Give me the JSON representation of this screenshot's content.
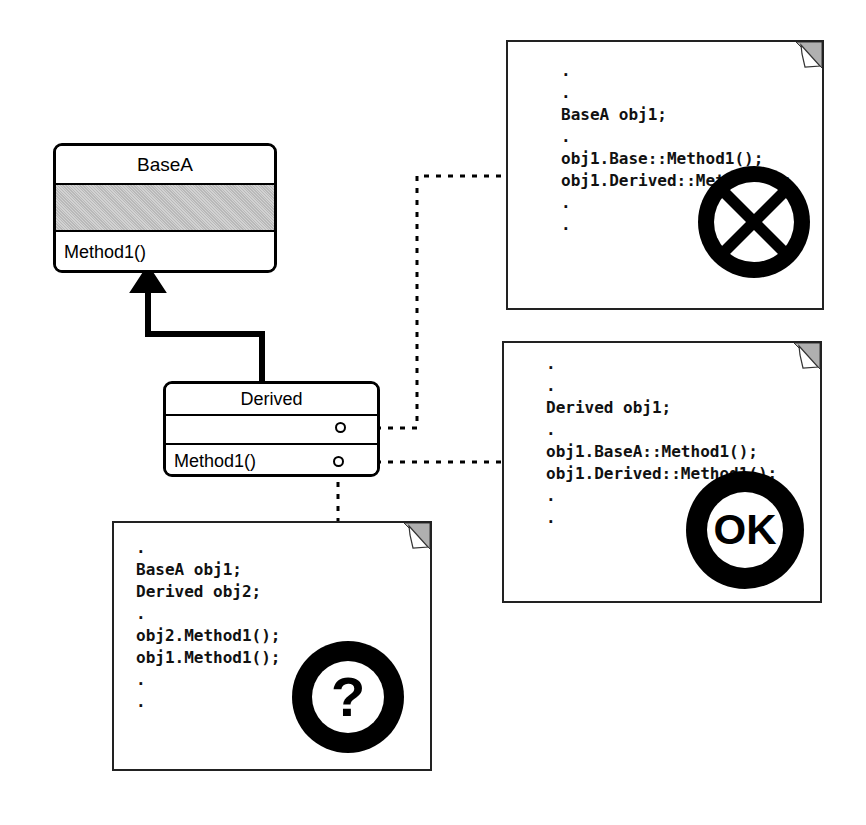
{
  "diagram": {
    "classes": [
      {
        "name": "BaseA",
        "attributes_label": "",
        "operations": [
          "Method1()"
        ]
      },
      {
        "name": "Derived",
        "attributes_label": "",
        "operations": [
          "Method1()"
        ]
      }
    ],
    "relationship": {
      "kind": "generalization",
      "from": "Derived",
      "to": "BaseA",
      "arrow": "hollow-triangle-filled"
    },
    "anchors": [
      {
        "id": "anchor-attributes",
        "label": ""
      },
      {
        "id": "anchor-method1",
        "label": ""
      }
    ]
  },
  "notes": [
    {
      "id": "note-error",
      "lines": [
        ".",
        ".",
        "BaseA obj1;",
        ".",
        "obj1.Base::Method1();",
        "obj1.Derived::Method1();",
        ".",
        "."
      ],
      "stamp": "X",
      "stamp_name": "x-mark-icon"
    },
    {
      "id": "note-ok",
      "lines": [
        ".",
        ".",
        "Derived obj1;",
        ".",
        "obj1.BaseA::Method1();",
        "obj1.Derived::Method1();",
        ".",
        "."
      ],
      "stamp": "OK",
      "stamp_name": "ok-mark-icon"
    },
    {
      "id": "note-question",
      "lines": [
        ".",
        "BaseA obj1;",
        "Derived obj2;",
        ".",
        "obj2.Method1();",
        "obj1.Method1();",
        ".",
        "."
      ],
      "stamp": "?",
      "stamp_name": "question-mark-icon"
    }
  ],
  "colors": {
    "stroke": "#000000",
    "note_stroke": "#222222",
    "fold_fill": "#b0b0b0",
    "shaded_compartment": "#c8c8c8",
    "background": "#ffffff"
  }
}
